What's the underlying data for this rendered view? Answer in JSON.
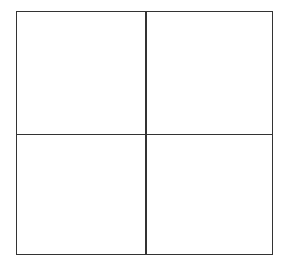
{
  "diagram": {
    "type": "2x2-grid",
    "rows": 2,
    "columns": 2,
    "line_color": "#333333",
    "background_color": "#ffffff",
    "cells": [
      {
        "row": 0,
        "col": 0,
        "label": ""
      },
      {
        "row": 0,
        "col": 1,
        "label": ""
      },
      {
        "row": 1,
        "col": 0,
        "label": ""
      },
      {
        "row": 1,
        "col": 1,
        "label": ""
      }
    ]
  }
}
